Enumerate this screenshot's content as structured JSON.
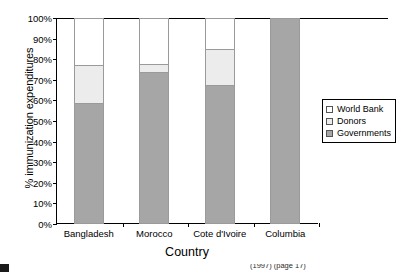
{
  "chart_data": {
    "type": "bar",
    "subtype": "stacked-100-percent",
    "title": "",
    "xlabel": "Country",
    "ylabel": "% immunization expenditures",
    "categories": [
      "Bangladesh",
      "Morocco",
      "Cote d'Ivoire",
      "Columbia"
    ],
    "ylim": [
      0,
      100
    ],
    "ytick_labels": [
      "0%",
      "10%",
      "20%",
      "30%",
      "40%",
      "50%",
      "60%",
      "70%",
      "80%",
      "90%",
      "100%"
    ],
    "ytick_values": [
      0,
      10,
      20,
      30,
      40,
      50,
      60,
      70,
      80,
      90,
      100
    ],
    "grid": false,
    "legend_position": "right",
    "stack_order_bottom_to_top": [
      "Governments",
      "Donors",
      "World Bank"
    ],
    "series": [
      {
        "name": "Governments",
        "color": "#a6a6a6",
        "values": [
          58.5,
          73.5,
          67.0,
          100.0
        ]
      },
      {
        "name": "Donors",
        "color": "#ececec",
        "values": [
          18.5,
          4.0,
          18.0,
          0.0
        ]
      },
      {
        "name": "World Bank",
        "color": "#ffffff",
        "values": [
          23.0,
          22.5,
          15.0,
          0.0
        ]
      }
    ]
  },
  "axes": {
    "y_title": "% immunization expenditures",
    "x_title": "Country"
  },
  "legend": {
    "items": [
      {
        "label": "World Bank",
        "color": "#ffffff"
      },
      {
        "label": "Donors",
        "color": "#ececec"
      },
      {
        "label": "Governments",
        "color": "#a6a6a6"
      }
    ]
  },
  "caption": {
    "text": "(1997) (page 17)"
  }
}
